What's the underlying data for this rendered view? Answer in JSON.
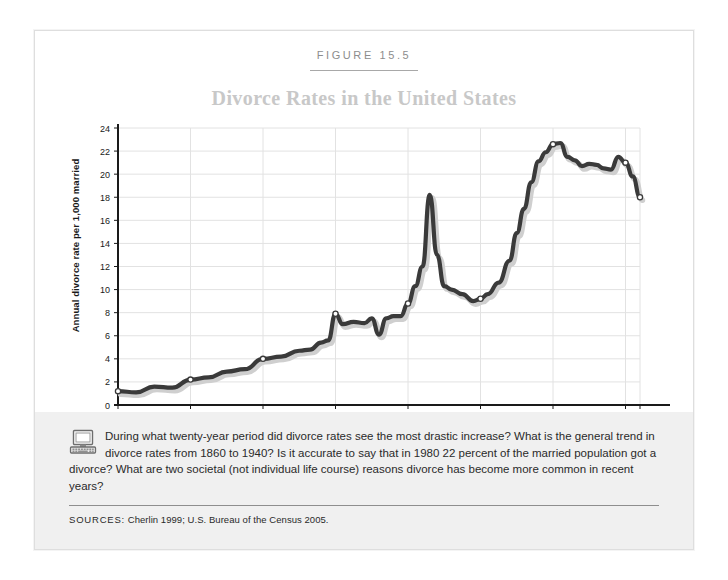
{
  "figure": {
    "number_label": "FIGURE 15.5",
    "title": "Divorce Rates in the United States"
  },
  "question_block": {
    "icon": "computer-icon",
    "text": "During what twenty-year period did divorce rates see the most drastic increase? What is the general trend in divorce rates from 1860 to 1940? Is it accurate to say that in 1980 22 percent of the married population got a divorce? What are two societal (not individual life course) reasons divorce has become more common in recent years?"
  },
  "sources": {
    "label": "SOURCES:",
    "text": " Cherlin 1999; U.S. Bureau of the Census 2005."
  },
  "colors": {
    "line": "#3a3a3a",
    "shadow": "#cfcfcf",
    "grid": "#e2e2e2",
    "axis": "#1a1a1a",
    "title": "#c8c8c8",
    "panel_bg": "#f0f0f0",
    "frame": "#dedede"
  },
  "chart_data": {
    "type": "line",
    "title": "Divorce Rates in the United States",
    "xlabel": "",
    "ylabel": "Annual divorce rate per 1,000 married",
    "xlim": [
      1860,
      2004
    ],
    "ylim": [
      0,
      24
    ],
    "grid": true,
    "legend": null,
    "x_ticks": [
      1860,
      1880,
      1900,
      1920,
      1940,
      1960,
      1980,
      2000,
      2004
    ],
    "x_tick_labels": [
      "1860",
      "1880",
      "1900",
      "1920",
      "1940",
      "1960",
      "1980",
      "2000",
      "2004"
    ],
    "y_ticks": [
      0,
      2,
      4,
      6,
      8,
      10,
      12,
      14,
      16,
      18,
      20,
      22,
      24
    ],
    "y_tick_labels": [
      "0",
      "2",
      "4",
      "6",
      "8",
      "10",
      "12",
      "14",
      "16",
      "18",
      "20",
      "22",
      "24"
    ],
    "marker_years": [
      1860,
      1880,
      1900,
      1920,
      1940,
      1960,
      1980,
      2000,
      2004
    ],
    "series": [
      {
        "name": "Annual divorce rate per 1,000 married women",
        "x": [
          1860,
          1865,
          1870,
          1875,
          1880,
          1885,
          1890,
          1895,
          1900,
          1905,
          1910,
          1913,
          1916,
          1918,
          1920,
          1922,
          1925,
          1928,
          1930,
          1932,
          1934,
          1936,
          1938,
          1940,
          1942,
          1944,
          1946,
          1948,
          1950,
          1952,
          1955,
          1958,
          1960,
          1962,
          1965,
          1968,
          1970,
          1972,
          1974,
          1976,
          1978,
          1980,
          1982,
          1984,
          1986,
          1988,
          1990,
          1992,
          1994,
          1996,
          1998,
          2000,
          2002,
          2004
        ],
        "y": [
          1.2,
          1.1,
          1.6,
          1.5,
          2.2,
          2.4,
          2.9,
          3.1,
          4.0,
          4.2,
          4.7,
          4.8,
          5.4,
          5.6,
          7.9,
          7.0,
          7.2,
          7.1,
          7.5,
          6.1,
          7.5,
          7.7,
          7.7,
          8.8,
          10.3,
          12.0,
          18.2,
          13.0,
          10.3,
          10.0,
          9.6,
          9.0,
          9.2,
          9.6,
          10.6,
          12.5,
          14.9,
          17.0,
          19.3,
          21.1,
          21.9,
          22.6,
          22.7,
          21.5,
          21.2,
          20.7,
          20.9,
          20.8,
          20.5,
          20.4,
          21.5,
          21.0,
          19.8,
          18.0
        ]
      }
    ],
    "annotations": [
      {
        "year": 1946,
        "value": 18.2,
        "note": "post-WWII spike"
      },
      {
        "year": 1980,
        "value": 22.6,
        "note": "peak"
      },
      {
        "year": 2004,
        "value": 18.0,
        "note": "final value"
      }
    ]
  }
}
